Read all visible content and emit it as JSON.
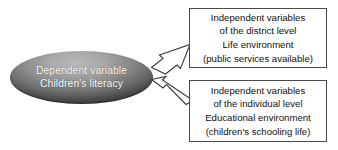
{
  "diagram": {
    "dependent_node": {
      "shape": "ellipse",
      "line1": "Dependent variable",
      "line2": "Children's literacy",
      "text_color": "#ffffff",
      "fill_top": "#b9b9b9",
      "fill_bottom": "#3c3c3c"
    },
    "boxes": [
      {
        "id": "district",
        "lines": [
          "Independent variables",
          "of the district level",
          "Life environment",
          "(public services available)"
        ],
        "border_color": "#4a4a4a",
        "fill": "#ffffff",
        "text_color": "#111111"
      },
      {
        "id": "individual",
        "lines": [
          "Independent variables",
          "of the individual level",
          "Educational environment",
          "(children's schooling life)"
        ],
        "border_color": "#4a4a4a",
        "fill": "#ffffff",
        "text_color": "#111111"
      }
    ],
    "arrows": [
      {
        "id": "district-to-dependent",
        "direction": "down-left",
        "from": "district box",
        "to": "dependent variable ellipse",
        "fill": "#ffffff",
        "stroke": "#3a3a3a"
      },
      {
        "id": "individual-to-dependent",
        "direction": "up-left",
        "from": "individual box",
        "to": "dependent variable ellipse",
        "fill": "#ffffff",
        "stroke": "#3a3a3a"
      }
    ]
  }
}
